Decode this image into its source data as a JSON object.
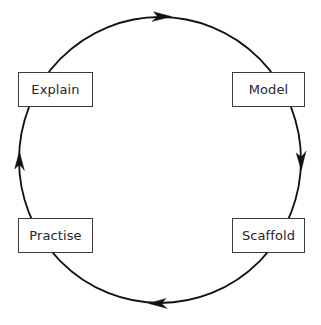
{
  "diagram": {
    "type": "cyclical-process",
    "direction": "clockwise",
    "background_color": "#ffffff",
    "stroke_color": "#111111",
    "box_border_color": "#3a3a3a",
    "text_color": "#262626",
    "cycle": {
      "center_x": 160,
      "center_y": 160,
      "radius_x": 142,
      "radius_y": 143,
      "stroke_width": 1.8
    },
    "nodes": [
      {
        "id": "explain",
        "label": "Explain",
        "position": "upper-left",
        "order": 1
      },
      {
        "id": "model",
        "label": "Model",
        "position": "upper-right",
        "order": 2
      },
      {
        "id": "scaffold",
        "label": "Scaffold",
        "position": "lower-right",
        "order": 3
      },
      {
        "id": "practise",
        "label": "Practise",
        "position": "lower-left",
        "order": 4
      }
    ],
    "arrows": [
      {
        "id": "arrow-top",
        "points": "right",
        "x": 166,
        "y": 17,
        "from": "explain",
        "to": "model"
      },
      {
        "id": "arrow-right",
        "points": "down",
        "x": 301,
        "y": 163,
        "from": "model",
        "to": "scaffold"
      },
      {
        "id": "arrow-bottom",
        "points": "left",
        "x": 158,
        "y": 303,
        "from": "scaffold",
        "to": "practise"
      },
      {
        "id": "arrow-left",
        "points": "up",
        "x": 19,
        "y": 160,
        "from": "practise",
        "to": "explain"
      }
    ]
  }
}
